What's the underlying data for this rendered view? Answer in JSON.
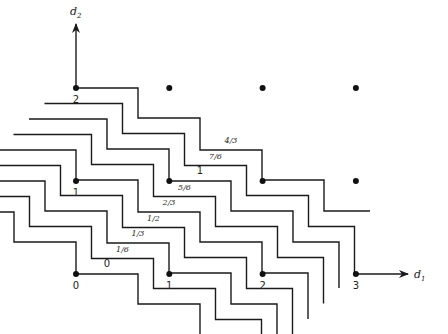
{
  "diagram": {
    "axes": {
      "x": {
        "label": "d",
        "subscript": "1"
      },
      "y": {
        "label": "d",
        "subscript": "2"
      }
    },
    "grid_points": [
      {
        "d1": 0,
        "d2": 0
      },
      {
        "d1": 1,
        "d2": 0
      },
      {
        "d1": 2,
        "d2": 0
      },
      {
        "d1": 3,
        "d2": 0
      },
      {
        "d1": 0,
        "d2": 1
      },
      {
        "d1": 1,
        "d2": 1
      },
      {
        "d1": 2,
        "d2": 1
      },
      {
        "d1": 3,
        "d2": 1
      },
      {
        "d1": 0,
        "d2": 2
      },
      {
        "d1": 1,
        "d2": 2
      },
      {
        "d1": 2,
        "d2": 2
      },
      {
        "d1": 3,
        "d2": 2
      }
    ],
    "point_labels": [
      {
        "text": "0",
        "d1": 0,
        "d2": 0
      },
      {
        "text": "1",
        "d1": 1,
        "d2": 0
      },
      {
        "text": "2",
        "d1": 2,
        "d2": 0
      },
      {
        "text": "3",
        "d1": 3,
        "d2": 0
      },
      {
        "text": "1",
        "d1": 0,
        "d2": 1
      },
      {
        "text": "2",
        "d1": 0,
        "d2": 2
      }
    ],
    "contour_labels": [
      "4/3",
      "7/6",
      "1",
      "5/6",
      "2/3",
      "1/2",
      "1/3",
      "1/6",
      "0"
    ]
  }
}
